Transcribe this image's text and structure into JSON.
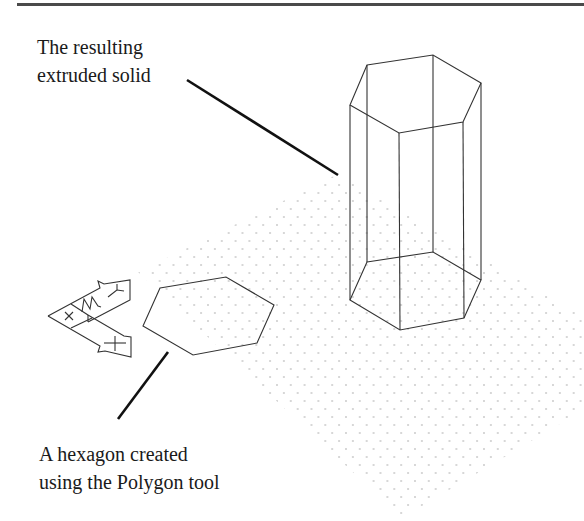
{
  "figure": {
    "callouts": [
      {
        "id": "solid",
        "lines": [
          "The resulting",
          "extruded solid"
        ]
      },
      {
        "id": "hexagon",
        "lines": [
          "A hexagon created",
          "using the Polygon tool"
        ]
      }
    ],
    "colors": {
      "line": "#333333",
      "leader": "#111111",
      "grid_dot": "#9a9a9a",
      "rule": "#4a4a4a",
      "background": "#ffffff"
    },
    "ucs_icon": {
      "axes": [
        "X",
        "Y",
        "Z"
      ]
    },
    "objects": [
      "isometric grid",
      "hexagon",
      "extruded hexagonal prism",
      "UCS icon"
    ]
  }
}
